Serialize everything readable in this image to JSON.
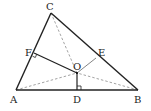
{
  "diagram": {
    "type": "triangle-geometry",
    "points": {
      "A": {
        "x": 16,
        "y": 90,
        "label": "A",
        "lx": 10,
        "ly": 103
      },
      "B": {
        "x": 138,
        "y": 90,
        "label": "B",
        "lx": 134,
        "ly": 103
      },
      "C": {
        "x": 51,
        "y": 13,
        "label": "C",
        "lx": 46,
        "ly": 10
      },
      "D": {
        "x": 77,
        "y": 90,
        "label": "D",
        "lx": 73,
        "ly": 103
      },
      "E": {
        "x": 96,
        "y": 58,
        "label": "E",
        "lx": 98,
        "ly": 56
      },
      "F": {
        "x": 34,
        "y": 53,
        "label": "F",
        "lx": 25,
        "ly": 56
      },
      "O": {
        "x": 77,
        "y": 73,
        "label": "O",
        "lx": 73,
        "ly": 70
      }
    },
    "labels": {
      "A": "A",
      "B": "B",
      "C": "C",
      "D": "D",
      "E": "E",
      "F": "F",
      "O": "O"
    },
    "segments": [
      {
        "from": "A",
        "to": "C",
        "style": "solid"
      },
      {
        "from": "C",
        "to": "B",
        "style": "solid"
      },
      {
        "from": "A",
        "to": "B",
        "style": "solid"
      },
      {
        "from": "F",
        "to": "O",
        "style": "solid"
      },
      {
        "from": "O",
        "to": "D",
        "style": "solid"
      },
      {
        "from": "O",
        "to": "E",
        "style": "thin"
      },
      {
        "from": "C",
        "to": "O",
        "style": "dashed"
      },
      {
        "from": "A",
        "to": "O",
        "style": "dashed"
      },
      {
        "from": "B",
        "to": "O",
        "style": "dashed"
      }
    ],
    "right_angles": [
      "F",
      "D"
    ],
    "colors": {
      "line": "#222222",
      "dashed": "#888888",
      "background": "#ffffff"
    }
  }
}
